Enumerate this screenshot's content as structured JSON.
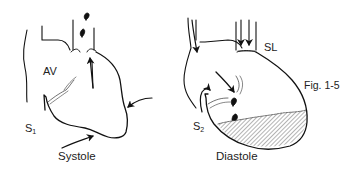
{
  "figure": {
    "number": "Fig. 1-5",
    "panels": [
      {
        "caption": "Systole",
        "labels": {
          "valve": "AV",
          "sound_letter": "S",
          "sound_sub": "1"
        }
      },
      {
        "caption": "Diastole",
        "labels": {
          "valve": "SL",
          "sound_letter": "S",
          "sound_sub": "2"
        }
      }
    ]
  },
  "colors": {
    "ink": "#111111",
    "background": "#ffffff"
  }
}
